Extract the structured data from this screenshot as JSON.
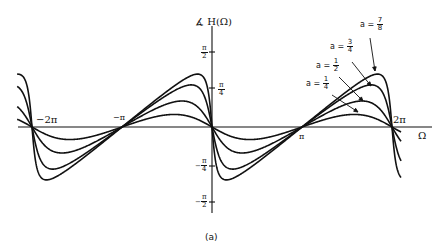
{
  "chart_data": {
    "type": "line",
    "title": "",
    "ylabel": "∡ H(Ω)",
    "xlabel": "Ω",
    "caption": "(a)",
    "x_ticks": [
      "−2π",
      "−π",
      "π",
      "2π"
    ],
    "y_ticks": [
      "π/2",
      "π/4",
      "−π/4",
      "−π/2"
    ],
    "xlim": [
      -6.8,
      6.6
    ],
    "ylim": [
      -1.7,
      1.7
    ],
    "grid": false,
    "formula": "∡H(Ω) = −arctan(a·sinΩ / (1 − a·cosΩ))",
    "series": [
      {
        "name": "a = 1/4",
        "a": 0.25,
        "peak": 0.253
      },
      {
        "name": "a = 1/2",
        "a": 0.5,
        "peak": 0.524
      },
      {
        "name": "a = 3/4",
        "a": 0.75,
        "peak": 0.848
      },
      {
        "name": "a = 7/8",
        "a": 0.875,
        "peak": 1.065
      }
    ]
  },
  "labels": {
    "ylabel_angle": "∡",
    "ylabel_text": "H(Ω)",
    "xlabel": "Ω",
    "caption": "(a)",
    "tick_neg2pi": "−2π",
    "tick_negpi": "−π",
    "tick_pi": "π",
    "tick_2pi": "2π",
    "pi": "π",
    "two": "2",
    "four": "4",
    "neg": "−",
    "a_eq": "a =",
    "a_values": [
      {
        "num": "1",
        "den": "4"
      },
      {
        "num": "1",
        "den": "2"
      },
      {
        "num": "3",
        "den": "4"
      },
      {
        "num": "7",
        "den": "8"
      }
    ]
  }
}
